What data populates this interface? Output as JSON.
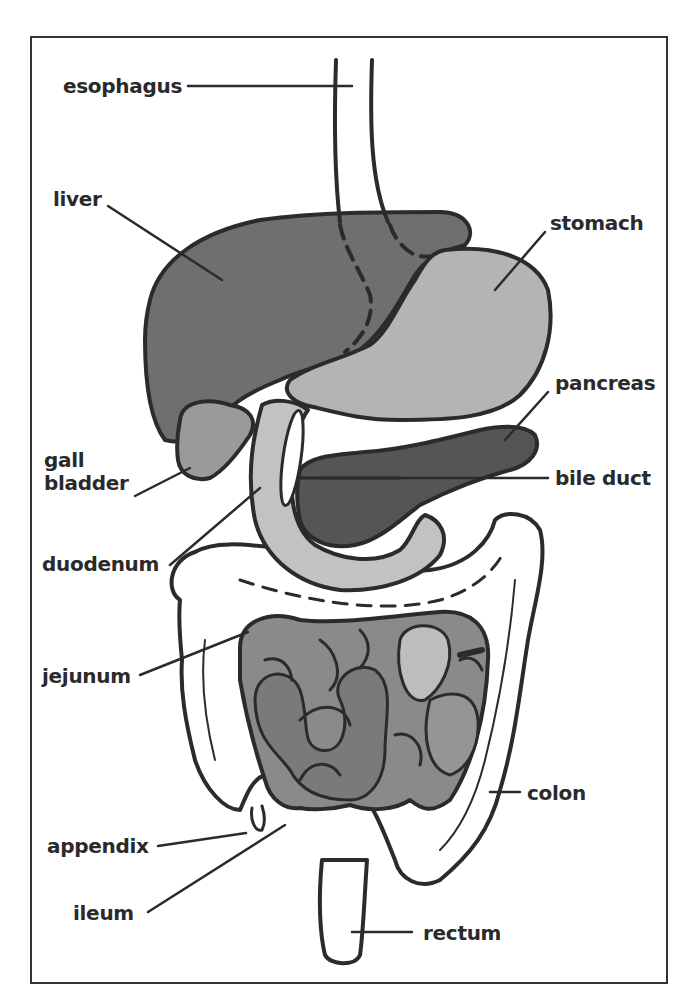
{
  "diagram": {
    "type": "anatomical-labeled-illustration",
    "colors": {
      "outline": "#2b2b2b",
      "liver": "#6f6f6f",
      "stomach": "#b4b4b4",
      "duodenum": "#c2c2c2",
      "pancreas": "#555555",
      "gall_bladder": "#9a9a9a",
      "small_intestine_dark": "#7a7a7a",
      "small_intestine_mid": "#959595",
      "small_intestine_light": "#bdbdbd",
      "colon": "#ffffff",
      "background": "#ffffff"
    },
    "labels": {
      "esophagus": "esophagus",
      "liver": "liver",
      "stomach": "stomach",
      "pancreas": "pancreas",
      "gall": "gall",
      "bladder": "bladder",
      "bile_duct": "bile duct",
      "duodenum": "duodenum",
      "jejunum": "jejunum",
      "colon": "colon",
      "appendix": "appendix",
      "ileum": "ileum",
      "rectum": "rectum"
    }
  }
}
